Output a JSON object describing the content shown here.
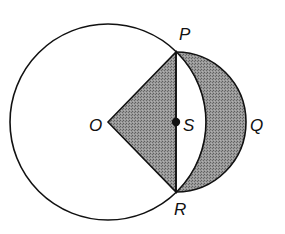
{
  "diagram": {
    "type": "geometry",
    "colors": {
      "stroke": "#111111",
      "shade": "#8c8c8c",
      "background": "#ffffff"
    },
    "points": {
      "O": {
        "label": "O",
        "x": 108,
        "y": 122
      },
      "P": {
        "label": "P",
        "x": 176,
        "y": 52
      },
      "R": {
        "label": "R",
        "x": 176,
        "y": 192
      },
      "S": {
        "label": "S",
        "x": 176,
        "y": 122
      },
      "Q": {
        "label": "Q",
        "x": 246,
        "y": 122
      }
    },
    "circle_O": {
      "cx": 108,
      "cy": 122,
      "r": 98
    },
    "semicircle_S": {
      "cx": 176,
      "cy": 122,
      "r": 70
    },
    "shaded_regions": [
      "triangle OPR",
      "lune between semicircle PQR and arc PR of circle O"
    ]
  }
}
